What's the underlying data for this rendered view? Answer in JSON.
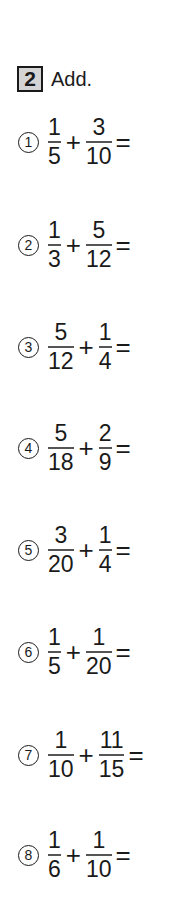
{
  "header": {
    "number": "2",
    "instruction": "Add."
  },
  "problems": [
    {
      "label": "①",
      "a_num": "1",
      "a_den": "5",
      "op": "+",
      "b_num": "3",
      "b_den": "10",
      "eq": "="
    },
    {
      "label": "②",
      "a_num": "1",
      "a_den": "3",
      "op": "+",
      "b_num": "5",
      "b_den": "12",
      "eq": "="
    },
    {
      "label": "③",
      "a_num": "5",
      "a_den": "12",
      "op": "+",
      "b_num": "1",
      "b_den": "4",
      "eq": "="
    },
    {
      "label": "④",
      "a_num": "5",
      "a_den": "18",
      "op": "+",
      "b_num": "2",
      "b_den": "9",
      "eq": "="
    },
    {
      "label": "⑤",
      "a_num": "3",
      "a_den": "20",
      "op": "+",
      "b_num": "1",
      "b_den": "4",
      "eq": "="
    },
    {
      "label": "⑥",
      "a_num": "1",
      "a_den": "5",
      "op": "+",
      "b_num": "1",
      "b_den": "20",
      "eq": "="
    },
    {
      "label": "⑦",
      "a_num": "1",
      "a_den": "10",
      "op": "+",
      "b_num": "11",
      "b_den": "15",
      "eq": "="
    },
    {
      "label": "⑧",
      "a_num": "1",
      "a_den": "6",
      "op": "+",
      "b_num": "1",
      "b_den": "10",
      "eq": "="
    }
  ]
}
